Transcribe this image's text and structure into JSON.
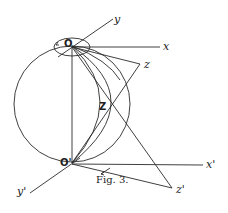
{
  "figure": {
    "caption": "Fig. 3.",
    "points": {
      "O": {
        "label": "O",
        "x": 72,
        "y": 46
      },
      "O_prime": {
        "label": "O'",
        "x": 72,
        "y": 163
      },
      "Z": {
        "label": "Z",
        "x": 110,
        "y": 106
      }
    },
    "axes_top": {
      "x": {
        "label": "x"
      },
      "y": {
        "label": "y"
      },
      "z": {
        "label": "z"
      }
    },
    "axes_bottom": {
      "x_prime": {
        "label": "x'"
      },
      "y_prime": {
        "label": "y'"
      },
      "z_prime": {
        "label": "z'"
      }
    }
  }
}
